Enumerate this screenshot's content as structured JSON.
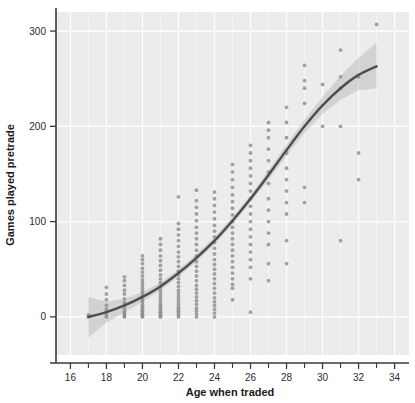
{
  "chart_data": {
    "type": "scatter",
    "title": "",
    "xlabel": "Age when traded",
    "ylabel": "Games played pretrade",
    "xlim": [
      15.2,
      34.8
    ],
    "ylim": [
      -40,
      320
    ],
    "xticks": [
      16,
      18,
      20,
      22,
      24,
      26,
      28,
      30,
      32,
      34
    ],
    "xminorticks": [
      17,
      19,
      21,
      23,
      25,
      27,
      29,
      31,
      33
    ],
    "yticks": [
      0,
      100,
      200,
      300
    ],
    "grid": true,
    "grid_color": "#ffffff",
    "panel_background": "#ececec",
    "point_color": "#8c8c8c",
    "line_color": "#4d4d4d",
    "band_color": "#b4b4b4",
    "legend": "none",
    "series": [
      {
        "name": "Games played pretrade",
        "type": "scatter",
        "points": [
          [
            17,
            0
          ],
          [
            17,
            2
          ],
          [
            18,
            0
          ],
          [
            18,
            2
          ],
          [
            18,
            5
          ],
          [
            18,
            8
          ],
          [
            18,
            12
          ],
          [
            18,
            18
          ],
          [
            18,
            24
          ],
          [
            18,
            31
          ],
          [
            19,
            0
          ],
          [
            19,
            1
          ],
          [
            19,
            3
          ],
          [
            19,
            4
          ],
          [
            19,
            6
          ],
          [
            19,
            9
          ],
          [
            19,
            12
          ],
          [
            19,
            15
          ],
          [
            19,
            19
          ],
          [
            19,
            24
          ],
          [
            19,
            28
          ],
          [
            19,
            33
          ],
          [
            19,
            38
          ],
          [
            19,
            42
          ],
          [
            20,
            0
          ],
          [
            20,
            1
          ],
          [
            20,
            2
          ],
          [
            20,
            3
          ],
          [
            20,
            4
          ],
          [
            20,
            6
          ],
          [
            20,
            7
          ],
          [
            20,
            9
          ],
          [
            20,
            11
          ],
          [
            20,
            13
          ],
          [
            20,
            16
          ],
          [
            20,
            18
          ],
          [
            20,
            21
          ],
          [
            20,
            24
          ],
          [
            20,
            27
          ],
          [
            20,
            30
          ],
          [
            20,
            33
          ],
          [
            20,
            36
          ],
          [
            20,
            39
          ],
          [
            20,
            43
          ],
          [
            20,
            47
          ],
          [
            20,
            51
          ],
          [
            20,
            56
          ],
          [
            20,
            60
          ],
          [
            20,
            64
          ],
          [
            21,
            0
          ],
          [
            21,
            1
          ],
          [
            21,
            2
          ],
          [
            21,
            4
          ],
          [
            21,
            5
          ],
          [
            21,
            7
          ],
          [
            21,
            9
          ],
          [
            21,
            11
          ],
          [
            21,
            13
          ],
          [
            21,
            16
          ],
          [
            21,
            19
          ],
          [
            21,
            22
          ],
          [
            21,
            25
          ],
          [
            21,
            28
          ],
          [
            21,
            32
          ],
          [
            21,
            36
          ],
          [
            21,
            40
          ],
          [
            21,
            44
          ],
          [
            21,
            49
          ],
          [
            21,
            54
          ],
          [
            21,
            59
          ],
          [
            21,
            64
          ],
          [
            21,
            70
          ],
          [
            21,
            76
          ],
          [
            21,
            82
          ],
          [
            22,
            0
          ],
          [
            22,
            2
          ],
          [
            22,
            4
          ],
          [
            22,
            6
          ],
          [
            22,
            8
          ],
          [
            22,
            10
          ],
          [
            22,
            13
          ],
          [
            22,
            16
          ],
          [
            22,
            19
          ],
          [
            22,
            22
          ],
          [
            22,
            25
          ],
          [
            22,
            28
          ],
          [
            22,
            32
          ],
          [
            22,
            36
          ],
          [
            22,
            40
          ],
          [
            22,
            44
          ],
          [
            22,
            48
          ],
          [
            22,
            53
          ],
          [
            22,
            58
          ],
          [
            22,
            63
          ],
          [
            22,
            68
          ],
          [
            22,
            74
          ],
          [
            22,
            80
          ],
          [
            22,
            86
          ],
          [
            22,
            92
          ],
          [
            22,
            98
          ],
          [
            22,
            126
          ],
          [
            23,
            0
          ],
          [
            23,
            3
          ],
          [
            23,
            6
          ],
          [
            23,
            9
          ],
          [
            23,
            13
          ],
          [
            23,
            17
          ],
          [
            23,
            21
          ],
          [
            23,
            25
          ],
          [
            23,
            29
          ],
          [
            23,
            33
          ],
          [
            23,
            38
          ],
          [
            23,
            43
          ],
          [
            23,
            48
          ],
          [
            23,
            53
          ],
          [
            23,
            58
          ],
          [
            23,
            64
          ],
          [
            23,
            70
          ],
          [
            23,
            76
          ],
          [
            23,
            82
          ],
          [
            23,
            88
          ],
          [
            23,
            94
          ],
          [
            23,
            101
          ],
          [
            23,
            108
          ],
          [
            23,
            115
          ],
          [
            23,
            122
          ],
          [
            23,
            133
          ],
          [
            24,
            0
          ],
          [
            24,
            4
          ],
          [
            24,
            8
          ],
          [
            24,
            12
          ],
          [
            24,
            16
          ],
          [
            24,
            20
          ],
          [
            24,
            25
          ],
          [
            24,
            30
          ],
          [
            24,
            35
          ],
          [
            24,
            40
          ],
          [
            24,
            45
          ],
          [
            24,
            50
          ],
          [
            24,
            55
          ],
          [
            24,
            60
          ],
          [
            24,
            66
          ],
          [
            24,
            72
          ],
          [
            24,
            78
          ],
          [
            24,
            84
          ],
          [
            24,
            90
          ],
          [
            24,
            96
          ],
          [
            24,
            103
          ],
          [
            24,
            110
          ],
          [
            24,
            117
          ],
          [
            24,
            124
          ],
          [
            24,
            131
          ],
          [
            25,
            18
          ],
          [
            25,
            30
          ],
          [
            25,
            34
          ],
          [
            25,
            40
          ],
          [
            25,
            46
          ],
          [
            25,
            52
          ],
          [
            25,
            58
          ],
          [
            25,
            64
          ],
          [
            25,
            70
          ],
          [
            25,
            76
          ],
          [
            25,
            82
          ],
          [
            25,
            88
          ],
          [
            25,
            94
          ],
          [
            25,
            100
          ],
          [
            25,
            107
          ],
          [
            25,
            114
          ],
          [
            25,
            121
          ],
          [
            25,
            128
          ],
          [
            25,
            136
          ],
          [
            25,
            144
          ],
          [
            25,
            152
          ],
          [
            25,
            160
          ],
          [
            26,
            5
          ],
          [
            26,
            40
          ],
          [
            26,
            52
          ],
          [
            26,
            60
          ],
          [
            26,
            68
          ],
          [
            26,
            76
          ],
          [
            26,
            84
          ],
          [
            26,
            92
          ],
          [
            26,
            100
          ],
          [
            26,
            108
          ],
          [
            26,
            116
          ],
          [
            26,
            124
          ],
          [
            26,
            132
          ],
          [
            26,
            140
          ],
          [
            26,
            148
          ],
          [
            26,
            156
          ],
          [
            26,
            164
          ],
          [
            26,
            172
          ],
          [
            26,
            180
          ],
          [
            27,
            38
          ],
          [
            27,
            56
          ],
          [
            27,
            76
          ],
          [
            27,
            88
          ],
          [
            27,
            100
          ],
          [
            27,
            112
          ],
          [
            27,
            124
          ],
          [
            27,
            140
          ],
          [
            27,
            152
          ],
          [
            27,
            164
          ],
          [
            27,
            176
          ],
          [
            27,
            188
          ],
          [
            27,
            196
          ],
          [
            27,
            204
          ],
          [
            28,
            56
          ],
          [
            28,
            80
          ],
          [
            28,
            108
          ],
          [
            28,
            120
          ],
          [
            28,
            132
          ],
          [
            28,
            144
          ],
          [
            28,
            156
          ],
          [
            28,
            172
          ],
          [
            28,
            188
          ],
          [
            28,
            204
          ],
          [
            28,
            220
          ],
          [
            29,
            120
          ],
          [
            29,
            136
          ],
          [
            29,
            224
          ],
          [
            29,
            240
          ],
          [
            29,
            248
          ],
          [
            29,
            264
          ],
          [
            30,
            200
          ],
          [
            30,
            244
          ],
          [
            31,
            80
          ],
          [
            31,
            200
          ],
          [
            31,
            240
          ],
          [
            31,
            252
          ],
          [
            31,
            280
          ],
          [
            32,
            144
          ],
          [
            32,
            172
          ],
          [
            32,
            252
          ],
          [
            33,
            307
          ]
        ]
      },
      {
        "name": "fitted curve",
        "type": "line",
        "points": [
          [
            17,
            0
          ],
          [
            18,
            5
          ],
          [
            19,
            12
          ],
          [
            20,
            21
          ],
          [
            21,
            32
          ],
          [
            22,
            46
          ],
          [
            23,
            62
          ],
          [
            24,
            80
          ],
          [
            25,
            101
          ],
          [
            26,
            124
          ],
          [
            27,
            149
          ],
          [
            28,
            175
          ],
          [
            29,
            200
          ],
          [
            30,
            222
          ],
          [
            31,
            240
          ],
          [
            32,
            254
          ],
          [
            33,
            263
          ]
        ]
      },
      {
        "name": "confidence band",
        "type": "band",
        "upper": [
          [
            17,
            21
          ],
          [
            18,
            16
          ],
          [
            19,
            19
          ],
          [
            20,
            26
          ],
          [
            21,
            36
          ],
          [
            22,
            50
          ],
          [
            23,
            66
          ],
          [
            24,
            84
          ],
          [
            25,
            105
          ],
          [
            26,
            128
          ],
          [
            27,
            154
          ],
          [
            28,
            181
          ],
          [
            29,
            207
          ],
          [
            30,
            231
          ],
          [
            31,
            253
          ],
          [
            32,
            272
          ],
          [
            33,
            288
          ]
        ],
        "lower": [
          [
            17,
            -22
          ],
          [
            18,
            -6
          ],
          [
            19,
            5
          ],
          [
            20,
            16
          ],
          [
            21,
            28
          ],
          [
            22,
            42
          ],
          [
            23,
            58
          ],
          [
            24,
            76
          ],
          [
            25,
            97
          ],
          [
            26,
            120
          ],
          [
            27,
            144
          ],
          [
            28,
            169
          ],
          [
            29,
            193
          ],
          [
            30,
            213
          ],
          [
            31,
            228
          ],
          [
            32,
            238
          ],
          [
            33,
            240
          ]
        ]
      }
    ]
  }
}
